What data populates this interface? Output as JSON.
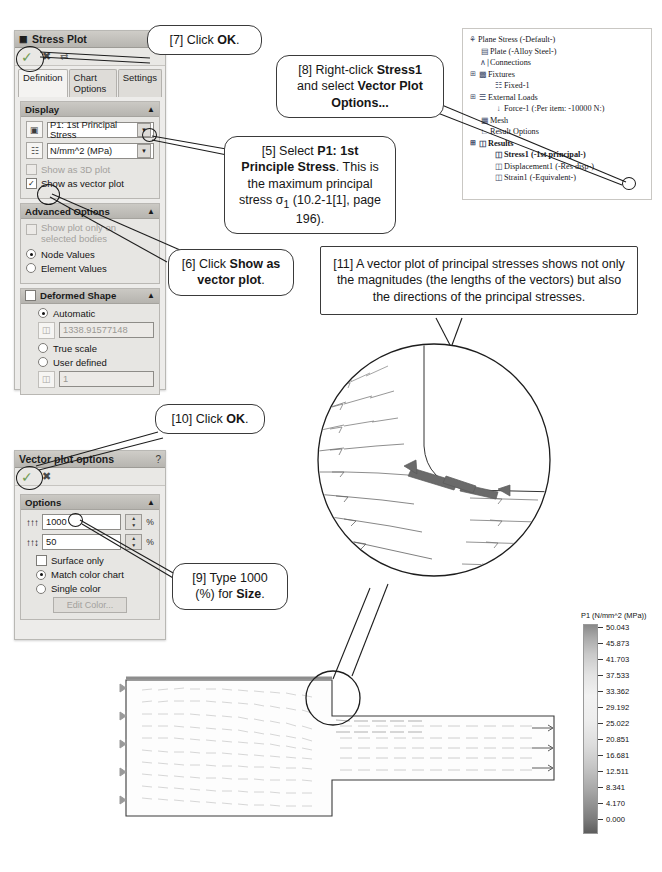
{
  "stress_plot_panel": {
    "title": "Stress Plot",
    "title_icon": "stress-plot-icon",
    "toolbar": {
      "ok": "✓",
      "cancel": "✖",
      "pin": "⇄"
    },
    "tabs": [
      {
        "label": "Definition",
        "active": true
      },
      {
        "label": "Chart Options",
        "active": false
      },
      {
        "label": "Settings",
        "active": false
      }
    ],
    "display_group": {
      "header": "Display",
      "component_value": "P1: 1st Principal Stress",
      "units_value": "N/mm^2 (MPa)",
      "show_3d_plot": {
        "label": "Show as 3D plot",
        "checked": false,
        "disabled": true
      },
      "show_vector_plot": {
        "label": "Show as vector plot",
        "checked": true,
        "disabled": false
      }
    },
    "advanced_group": {
      "header": "Advanced Options",
      "selected_bodies": {
        "label": "Show plot only on selected bodies",
        "checked": false,
        "disabled": true
      },
      "node_values": {
        "label": "Node Values",
        "selected": true
      },
      "element_values": {
        "label": "Element Values",
        "selected": false
      }
    },
    "deformed_group": {
      "header": "Deformed Shape",
      "header_checked": false,
      "automatic": {
        "label": "Automatic",
        "selected": true
      },
      "automatic_value": "1338.91577148",
      "true_scale": {
        "label": "True scale",
        "selected": false
      },
      "user_defined": {
        "label": "User defined",
        "selected": false
      },
      "user_defined_value": "1"
    }
  },
  "vector_panel": {
    "title": "Vector plot options",
    "help": "?",
    "toolbar": {
      "ok": "✓",
      "cancel": "✖"
    },
    "options_group": {
      "header": "Options",
      "size_icon": "vector-size-icon",
      "size_value": "1000",
      "size_unit": "%",
      "density_icon": "vector-density-icon",
      "density_value": "50",
      "density_unit": "%",
      "surface_only": {
        "label": "Surface only",
        "checked": false
      },
      "match_color_chart": {
        "label": "Match color chart",
        "selected": true
      },
      "single_color": {
        "label": "Single color",
        "selected": false
      },
      "edit_color": "Edit Color..."
    }
  },
  "feature_tree": {
    "nodes": [
      {
        "label": "Plane Stress (-Default-)",
        "indent": 0,
        "icon": "study-icon",
        "bold": false,
        "expander": ""
      },
      {
        "label": "Plate (-Alloy Steel-)",
        "indent": 1,
        "icon": "part-icon",
        "bold": false,
        "expander": ""
      },
      {
        "label": "Connections",
        "indent": 1,
        "icon": "connections-icon",
        "bold": false,
        "expander": ""
      },
      {
        "label": "Fixtures",
        "indent": 1,
        "icon": "fixtures-icon",
        "bold": false,
        "expander": "−"
      },
      {
        "label": "Fixed-1",
        "indent": 2,
        "icon": "fixed-icon",
        "bold": false,
        "expander": ""
      },
      {
        "label": "External Loads",
        "indent": 1,
        "icon": "loads-icon",
        "bold": false,
        "expander": "−"
      },
      {
        "label": "Force-1 (:Per item: -10000 N:)",
        "indent": 2,
        "icon": "force-icon",
        "bold": false,
        "expander": ""
      },
      {
        "label": "Mesh",
        "indent": 1,
        "icon": "mesh-icon",
        "bold": false,
        "expander": ""
      },
      {
        "label": "Result Options",
        "indent": 1,
        "icon": "result-options-icon",
        "bold": false,
        "expander": ""
      },
      {
        "label": "Results",
        "indent": 1,
        "icon": "results-icon",
        "bold": true,
        "expander": "−"
      },
      {
        "label": "Stress1 (-1st principal-)",
        "indent": 2,
        "icon": "plot-icon",
        "bold": true,
        "expander": ""
      },
      {
        "label": "Displacement1 (-Res disp-)",
        "indent": 2,
        "icon": "plot-icon",
        "bold": false,
        "expander": ""
      },
      {
        "label": "Strain1 (-Equivalent-)",
        "indent": 2,
        "icon": "plot-icon",
        "bold": false,
        "expander": ""
      }
    ]
  },
  "callouts": {
    "c7": {
      "html": "[7] Click <b>OK</b>."
    },
    "c8": {
      "html": "[8] Right-click <b>Stress1</b> and select <b>Vector Plot Options...</b>"
    },
    "c5": {
      "html": "[5] Select <b>P1: 1st Principle Stress</b>. This is the maximum principal stress &sigma;<sub>1</sub> (10.2-1[1], page 196)."
    },
    "c6": {
      "html": "[6] Click <b>Show as vector plot</b>."
    },
    "c10": {
      "html": "[10] Click <b>OK</b>."
    },
    "c9": {
      "html": "[9] Type 1000 (%) for <b>Size</b>."
    },
    "c11": {
      "html": "[11] A vector plot of principal stresses shows not only the magnitudes (the lengths of the vectors) but also the directions of the principal stresses."
    }
  },
  "chart_data": {
    "type": "heatmap",
    "title": "P1 (N/mm^2 (MPa))",
    "legend_position": "right",
    "unit": "N/mm^2 (MPa)",
    "ylim": [
      0.0,
      50.043
    ],
    "tick_labels": [
      "50.043",
      "45.873",
      "41.703",
      "37.533",
      "33.362",
      "29.192",
      "25.022",
      "20.851",
      "16.681",
      "12.511",
      "8.341",
      "4.170",
      "0.000"
    ],
    "values": [
      50.043,
      45.873,
      41.703,
      37.533,
      33.362,
      29.192,
      25.022,
      20.851,
      16.681,
      12.511,
      8.341,
      4.17,
      0.0
    ],
    "colormap": "grayscale"
  }
}
